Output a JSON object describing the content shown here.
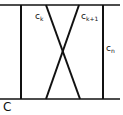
{
  "diagram": {
    "labels": {
      "ck": {
        "base": "c",
        "sub": "k"
      },
      "ck1": {
        "base": "c",
        "sub": "k+1"
      },
      "cn": {
        "base": "c",
        "sub": "n"
      },
      "C": "C"
    },
    "colors": {
      "stroke": "#111111",
      "background": "#ffffff"
    }
  }
}
